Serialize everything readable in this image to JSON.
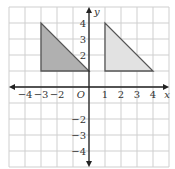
{
  "axes": {
    "x_label": "x",
    "y_label": "y",
    "origin_label": "O",
    "x_ticks": [
      -4,
      -3,
      -2,
      1,
      2,
      3,
      4
    ],
    "y_ticks": [
      4,
      3,
      2,
      -2,
      -3,
      -4
    ],
    "range": [
      -5,
      5
    ]
  },
  "triangles": [
    {
      "name": "left",
      "vertices": [
        [
          -3,
          4
        ],
        [
          -3,
          1
        ],
        [
          0,
          1
        ]
      ],
      "fill": "#b0b0b0"
    },
    {
      "name": "right",
      "vertices": [
        [
          1,
          4
        ],
        [
          1,
          1
        ],
        [
          4,
          1
        ]
      ],
      "fill": "#e2e2e2"
    }
  ],
  "colors": {
    "grid": "#cfcfcf",
    "axis": "#222222",
    "edge": "#555555"
  }
}
